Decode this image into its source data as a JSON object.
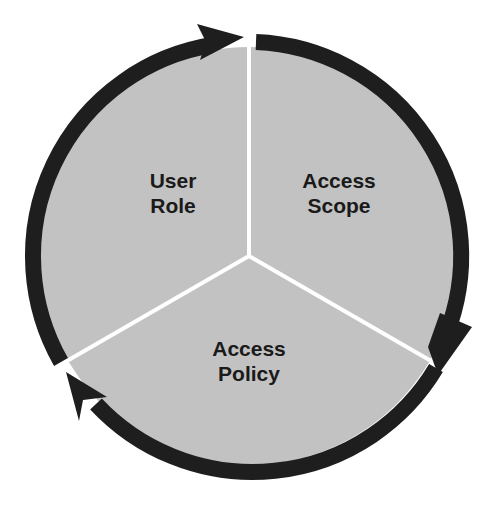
{
  "diagram": {
    "type": "cycle",
    "colors": {
      "fill": "#c2c2c2",
      "ring": "#1e1e1e",
      "divider": "#ffffff",
      "text": "#1a1a1a"
    },
    "segments": [
      {
        "id": "user-role",
        "line1": "User",
        "line2": "Role"
      },
      {
        "id": "access-scope",
        "line1": "Access",
        "line2": "Scope"
      },
      {
        "id": "access-policy",
        "line1": "Access",
        "line2": "Policy"
      }
    ],
    "flow_direction": "clockwise",
    "arrows": 3
  }
}
